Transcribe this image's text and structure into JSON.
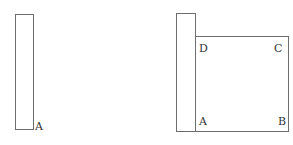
{
  "figure": {
    "left": {
      "strip_label": "A"
    },
    "right": {
      "labels": {
        "D": "D",
        "C": "C",
        "A": "A",
        "B": "B"
      }
    }
  },
  "colors": {
    "stroke": "#6e6e6e",
    "text": "#333333",
    "background": "#ffffff"
  }
}
